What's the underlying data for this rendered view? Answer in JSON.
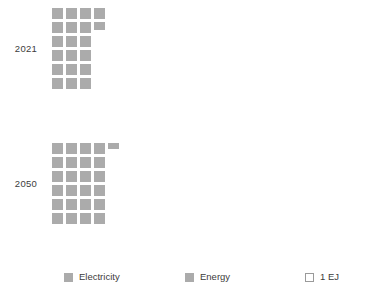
{
  "chart_data": {
    "type": "bar",
    "title": "",
    "subtitle": "",
    "xlabel": "",
    "ylabel": "",
    "unit": "EJ",
    "unit_label": "1 EJ",
    "grid": false,
    "legend_position": "bottom",
    "cells_per_row": 4,
    "categories": [
      "2021",
      "2050"
    ],
    "series": [
      {
        "name": "Electricity",
        "values": [
          21.7,
          24.5
        ]
      },
      {
        "name": "Energy",
        "values": [
          21.7,
          24.5
        ]
      }
    ],
    "groups": [
      {
        "label": "2021",
        "value": 21.7,
        "full_cells": 21,
        "partial_cell": 0.7,
        "rows": [
          {
            "full": 3,
            "partial": 0
          },
          {
            "full": 3,
            "partial": 0
          },
          {
            "full": 3,
            "partial": 0
          },
          {
            "full": 3,
            "partial": 0
          },
          {
            "full": 3,
            "partial": 0.7
          },
          {
            "full": 4,
            "partial": 0
          }
        ]
      },
      {
        "label": "2050",
        "value": 24.5,
        "full_cells": 24,
        "partial_cell": 0.5,
        "rows": [
          {
            "full": 4,
            "partial": 0
          },
          {
            "full": 4,
            "partial": 0
          },
          {
            "full": 4,
            "partial": 0
          },
          {
            "full": 4,
            "partial": 0
          },
          {
            "full": 4,
            "partial": 0
          },
          {
            "full": 4,
            "partial": 0.5
          }
        ]
      }
    ]
  },
  "groups": [
    {
      "label": "2021"
    },
    {
      "label": "2050"
    }
  ],
  "legend": {
    "items": [
      {
        "label": "Electricity",
        "swatch": "filled",
        "color": "#ababab"
      },
      {
        "label": "Energy",
        "swatch": "filled",
        "color": "#ababab"
      },
      {
        "label": "1 EJ",
        "swatch": "outline",
        "color": "#ffffff"
      }
    ]
  },
  "colors": {
    "cell": "#ababab",
    "outline": "#9a9a9a",
    "text": "#3c3c3c",
    "background": "#ffffff"
  }
}
